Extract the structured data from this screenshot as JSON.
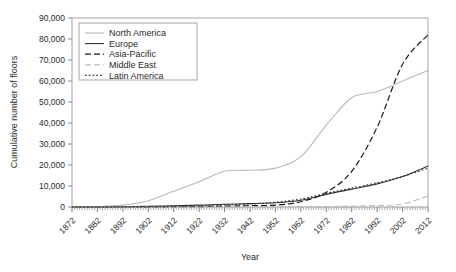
{
  "chart_data": {
    "type": "line",
    "title": "",
    "xlabel": "Year",
    "ylabel": "Cumulative number of floors",
    "xlim": [
      1872,
      2012
    ],
    "ylim": [
      0,
      90000
    ],
    "ytick_labels": [
      "0",
      "10,000",
      "20,000",
      "30,000",
      "40,000",
      "50,000",
      "60,000",
      "70,000",
      "80,000",
      "90,000"
    ],
    "ytick_values": [
      0,
      10000,
      20000,
      30000,
      40000,
      50000,
      60000,
      70000,
      80000,
      90000
    ],
    "xtick_labels": [
      "1872",
      "1882",
      "1892",
      "1902",
      "1912",
      "1922",
      "1932",
      "1942",
      "1952",
      "1962",
      "1972",
      "1982",
      "1992",
      "2002",
      "2012"
    ],
    "xtick_values": [
      1872,
      1882,
      1892,
      1902,
      1912,
      1922,
      1932,
      1942,
      1952,
      1962,
      1972,
      1982,
      1992,
      2002,
      2012
    ],
    "minor_xticks": "annual",
    "grid": false,
    "legend_position": "top-left",
    "x": [
      1872,
      1882,
      1892,
      1902,
      1912,
      1922,
      1932,
      1942,
      1952,
      1962,
      1972,
      1982,
      1992,
      2002,
      2012
    ],
    "series": [
      {
        "name": "North America",
        "color": "#b9b9b9",
        "dash": "none",
        "values": [
          0,
          200,
          900,
          3000,
          7500,
          12000,
          17000,
          17500,
          18500,
          24000,
          39000,
          52000,
          55000,
          60000,
          65000
        ]
      },
      {
        "name": "Europe",
        "color": "#333333",
        "dash": "none",
        "values": [
          0,
          0,
          100,
          300,
          600,
          900,
          1300,
          1600,
          2000,
          3200,
          6000,
          8500,
          11000,
          14500,
          19500
        ]
      },
      {
        "name": "Asia-Pacific",
        "color": "#1a1a1a",
        "dash": "dashed",
        "values": [
          0,
          0,
          0,
          0,
          100,
          200,
          400,
          600,
          900,
          2500,
          7000,
          17000,
          38000,
          68000,
          82000
        ]
      },
      {
        "name": "Middle East",
        "color": "#bdbdbd",
        "dash": "dashed",
        "values": [
          0,
          0,
          0,
          0,
          0,
          0,
          0,
          0,
          0,
          100,
          200,
          400,
          700,
          1500,
          5200
        ]
      },
      {
        "name": "Latin America",
        "color": "#2b2b2b",
        "dash": "dotted",
        "values": [
          0,
          0,
          0,
          100,
          300,
          600,
          1000,
          1500,
          2200,
          3800,
          6500,
          9000,
          11500,
          14500,
          18500
        ]
      }
    ]
  }
}
